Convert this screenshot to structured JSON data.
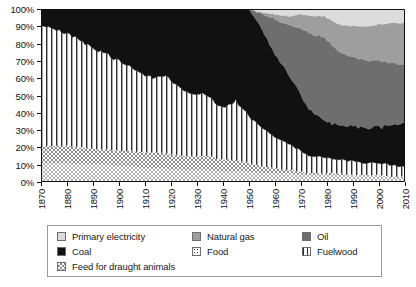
{
  "chart_data": {
    "type": "area",
    "title": "",
    "subtitle": "",
    "xlabel": "",
    "ylabel": "",
    "stacked": true,
    "normalized_percent": true,
    "grid": false,
    "legend_position": "bottom",
    "xlim": [
      1870,
      2010
    ],
    "ylim": [
      0,
      100
    ],
    "x_tick_labels": [
      "1870",
      "1880",
      "1890",
      "1900",
      "1910",
      "1920",
      "1930",
      "1940",
      "1950",
      "1960",
      "1970",
      "1980",
      "1990",
      "2000",
      "2010"
    ],
    "y_tick_labels": [
      "0%",
      "10%",
      "20%",
      "30%",
      "40%",
      "50%",
      "60%",
      "70%",
      "80%",
      "90%",
      "100%"
    ],
    "y_tick_values": [
      0,
      10,
      20,
      30,
      40,
      50,
      60,
      70,
      80,
      90,
      100
    ],
    "x": [
      1870,
      1875,
      1880,
      1885,
      1890,
      1895,
      1900,
      1905,
      1910,
      1913,
      1915,
      1918,
      1920,
      1925,
      1929,
      1932,
      1935,
      1938,
      1940,
      1942,
      1944,
      1945,
      1946,
      1948,
      1950,
      1955,
      1960,
      1965,
      1970,
      1973,
      1975,
      1979,
      1980,
      1985,
      1990,
      1995,
      2000,
      2005,
      2008,
      2010
    ],
    "series": [
      {
        "name": "Food",
        "key": "food",
        "pattern": "dots",
        "color": "#f2f2f2",
        "values": [
          11,
          11,
          11,
          10,
          10,
          10,
          9,
          9,
          8,
          8,
          8,
          8,
          7,
          7,
          7,
          7,
          7,
          6,
          6,
          6,
          6,
          6,
          6,
          6,
          6,
          5,
          5,
          5,
          4,
          4,
          4,
          4,
          4,
          4,
          4,
          4,
          4,
          3,
          3,
          3
        ]
      },
      {
        "name": "Feed for draught animals",
        "key": "feed_draught_animals",
        "pattern": "checker",
        "color": "#c9c9c9",
        "values": [
          10,
          10,
          10,
          10,
          9,
          9,
          9,
          9,
          9,
          9,
          9,
          9,
          9,
          8,
          8,
          8,
          8,
          7,
          7,
          7,
          7,
          7,
          6,
          6,
          5,
          4,
          3,
          2,
          2,
          1,
          1,
          1,
          1,
          1,
          0,
          0,
          0,
          0,
          0,
          0
        ]
      },
      {
        "name": "Fuelwood",
        "key": "fuelwood",
        "pattern": "vertical-lines",
        "color": "#ffffff",
        "values": [
          70,
          68,
          65,
          62,
          58,
          55,
          52,
          48,
          45,
          43,
          44,
          45,
          42,
          38,
          35,
          36,
          34,
          31,
          30,
          31,
          33,
          35,
          33,
          30,
          27,
          22,
          18,
          15,
          12,
          10,
          10,
          9,
          9,
          8,
          8,
          7,
          7,
          7,
          6,
          6
        ]
      },
      {
        "name": "Coal",
        "key": "coal",
        "pattern": "solid",
        "color": "#111111",
        "values": [
          9,
          11,
          14,
          18,
          23,
          26,
          30,
          34,
          38,
          40,
          39,
          38,
          42,
          47,
          50,
          49,
          51,
          56,
          57,
          56,
          54,
          52,
          55,
          58,
          62,
          57,
          48,
          41,
          33,
          27,
          25,
          22,
          21,
          20,
          20,
          20,
          21,
          23,
          25,
          26
        ]
      },
      {
        "name": "Oil",
        "key": "oil",
        "pattern": "solid",
        "color": "#6e6e6e",
        "values": [
          0,
          0,
          0,
          0,
          0,
          0,
          0,
          0,
          0,
          0,
          0,
          0,
          0,
          0,
          0,
          0,
          0,
          0,
          0,
          0,
          0,
          0,
          0,
          0,
          0,
          9,
          20,
          28,
          38,
          44,
          45,
          48,
          47,
          42,
          40,
          39,
          38,
          36,
          34,
          33
        ]
      },
      {
        "name": "Natural gas",
        "key": "natural_gas",
        "pattern": "solid",
        "color": "#9e9e9e",
        "values": [
          0,
          0,
          0,
          0,
          0,
          0,
          0,
          0,
          0,
          0,
          0,
          0,
          0,
          0,
          0,
          0,
          0,
          0,
          0,
          0,
          0,
          0,
          0,
          0,
          0,
          1,
          3,
          5,
          8,
          10,
          11,
          12,
          13,
          16,
          18,
          20,
          21,
          23,
          24,
          24
        ]
      },
      {
        "name": "Primary electricity",
        "key": "primary_electricity",
        "pattern": "solid",
        "color": "#dcdcdc",
        "values": [
          0,
          0,
          0,
          0,
          0,
          0,
          0,
          0,
          0,
          0,
          0,
          0,
          0,
          0,
          0,
          0,
          0,
          0,
          0,
          0,
          0,
          0,
          0,
          0,
          0,
          2,
          3,
          4,
          3,
          4,
          4,
          4,
          5,
          9,
          10,
          10,
          9,
          8,
          8,
          8
        ]
      }
    ],
    "legend": {
      "rows": [
        [
          {
            "label": "Primary electricity",
            "key": "primary_electricity",
            "swatch": "solid-light"
          },
          {
            "label": "Natural gas",
            "key": "natural_gas",
            "swatch": "solid-midlight"
          },
          {
            "label": "Oil",
            "key": "oil",
            "swatch": "solid-mid"
          }
        ],
        [
          {
            "label": "Coal",
            "key": "coal",
            "swatch": "solid-black"
          },
          {
            "label": "Food",
            "key": "food",
            "swatch": "dots"
          },
          {
            "label": "Fuelwood",
            "key": "fuelwood",
            "swatch": "vertical-lines"
          }
        ],
        [
          {
            "label": "Feed for draught animals",
            "key": "feed_draught_animals",
            "swatch": "checker"
          }
        ]
      ]
    },
    "colors": {
      "primary_electricity": "#dcdcdc",
      "natural_gas": "#9e9e9e",
      "oil": "#6e6e6e",
      "coal": "#111111",
      "food": "#f2f2f2",
      "fuelwood": "#ffffff",
      "feed_draught_animals": "#c9c9c9",
      "axis": "#111111",
      "legend_border": "#9a9a9a"
    }
  }
}
